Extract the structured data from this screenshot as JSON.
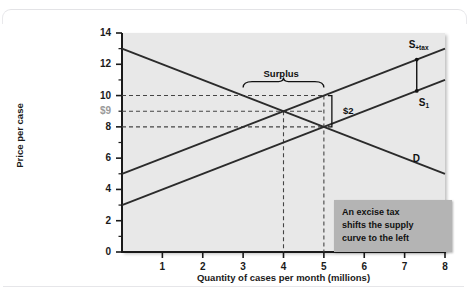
{
  "figure": {
    "cutoff_top_text": "",
    "background_color": "#ffffff",
    "plot_bg_color": "#e8e8e8",
    "callout_bg_color": "#b4b4b4",
    "dollar_label_color": "#9a9a9a",
    "line_color": "#2b2b2b"
  },
  "chart_data": {
    "type": "line",
    "title": "",
    "xlabel": "Quantity of cases per month (millions)",
    "ylabel": "Price per case",
    "xlim": [
      0,
      8
    ],
    "ylim": [
      0,
      14
    ],
    "grid": false,
    "legend": "inline-curve-labels",
    "x_ticks": [
      1,
      2,
      3,
      4,
      5,
      6,
      7,
      8
    ],
    "x_tick_labels": [
      "1",
      "2",
      "3",
      "4",
      "5",
      "6",
      "7",
      "8"
    ],
    "y_ticks": [
      0,
      2,
      4,
      6,
      8,
      10,
      12,
      14
    ],
    "y_tick_labels": [
      "0",
      "2",
      "4",
      "6",
      "8",
      "10",
      "12",
      "14"
    ],
    "y_minor_ticks": [
      1,
      3,
      5,
      7,
      9,
      11,
      13
    ],
    "special_y_label": "$9",
    "special_y_value": 9,
    "series": [
      {
        "name": "D",
        "label": "D",
        "kind": "demand",
        "points": [
          [
            0,
            13
          ],
          [
            8,
            5
          ]
        ],
        "label_x": 7.2,
        "label_y": 5.9
      },
      {
        "name": "S1",
        "label": "S",
        "label_sub": "1",
        "kind": "supply-before-tax",
        "points": [
          [
            0,
            3
          ],
          [
            8,
            11
          ]
        ],
        "label_x": 7.35,
        "label_y": 9.45
      },
      {
        "name": "S+tax",
        "label": "S",
        "label_sub": "+tax",
        "kind": "supply-after-tax",
        "points": [
          [
            0,
            5
          ],
          [
            8,
            13
          ]
        ],
        "label_x": 7.1,
        "label_y": 13.2
      }
    ],
    "equilibria": [
      {
        "name": "after-tax",
        "x": 4,
        "y": 9
      },
      {
        "name": "before-tax",
        "x": 5,
        "y": 8
      }
    ],
    "guides": {
      "horizontal_dashed": [
        10,
        9,
        8
      ],
      "vertical_dashed": [
        4,
        5
      ]
    },
    "annotations": [
      {
        "name": "surplus-brace",
        "text": "Surplus",
        "from_x": 3,
        "to_x": 5,
        "at_y": 10,
        "text_x": 4,
        "text_y": 11.35
      },
      {
        "name": "tax-wedge-bracket",
        "text": "$2",
        "at_x": 5,
        "from_y": 8,
        "to_y": 10,
        "text_x": 5.25,
        "text_y": 9
      },
      {
        "name": "supply-shift-connector",
        "at_x": 7.3,
        "from_y": 10.3,
        "to_y": 12.3
      }
    ],
    "callout": {
      "line1": "An excise tax",
      "line2": "shifts the supply",
      "line3": "curve to the left"
    }
  }
}
